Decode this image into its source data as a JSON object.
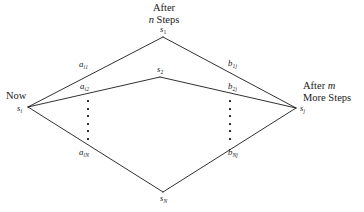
{
  "figure": {
    "type": "state-transition-diagram",
    "headings": {
      "top_line1": "After",
      "top_line2_italic": "n",
      "top_line2_rest": " Steps",
      "left": "Now",
      "right_line1_rest": "After ",
      "right_line1_italic": "m",
      "right_line2": "More Steps"
    },
    "nodes": [
      {
        "id": "now",
        "symbol": "s",
        "sub": "i",
        "sub_italic": true,
        "x": 28,
        "y": 107,
        "label_dx": -11,
        "label_dy": -3
      },
      {
        "id": "mid1",
        "symbol": "s",
        "sub": "1",
        "sub_italic": false,
        "x": 163,
        "y": 37,
        "label_dx": -3,
        "label_dy": -12
      },
      {
        "id": "mid2",
        "symbol": "s",
        "sub": "2",
        "sub_italic": false,
        "x": 160,
        "y": 77,
        "label_dx": -3,
        "label_dy": -12
      },
      {
        "id": "midN",
        "symbol": "s",
        "sub": "N",
        "sub_italic": true,
        "x": 163,
        "y": 192,
        "label_dx": -3,
        "label_dy": 2
      },
      {
        "id": "end",
        "symbol": "s",
        "sub": "j",
        "sub_italic": true,
        "x": 296,
        "y": 108,
        "label_dx": 4,
        "label_dy": -4
      }
    ],
    "edges": [
      {
        "id": "a-i1",
        "from": "now",
        "to": "mid1",
        "symbol": "a",
        "sub": "i1",
        "label_x": 79,
        "label_y": 60
      },
      {
        "id": "a-i2",
        "from": "now",
        "to": "mid2",
        "symbol": "a",
        "sub": "i2",
        "label_x": 80,
        "label_y": 82
      },
      {
        "id": "a-iN",
        "from": "now",
        "to": "midN",
        "symbol": "a",
        "sub": "iN",
        "label_x": 79,
        "label_y": 148
      },
      {
        "id": "b-1j",
        "from": "mid1",
        "to": "end",
        "symbol": "b",
        "sub": "1j",
        "label_x": 228,
        "label_y": 59
      },
      {
        "id": "b-2j",
        "from": "mid2",
        "to": "end",
        "symbol": "b",
        "sub": "2j",
        "label_x": 228,
        "label_y": 82
      },
      {
        "id": "b-Nj",
        "from": "midN",
        "to": "end",
        "symbol": "b",
        "sub": "Nj",
        "label_x": 228,
        "label_y": 148
      }
    ],
    "ellipsis_columns": [
      {
        "id": "left-ellipsis",
        "x": 88,
        "y_top": 100,
        "y_bottom": 140,
        "count": 6
      },
      {
        "id": "right-ellipsis",
        "x": 230,
        "y_top": 100,
        "y_bottom": 140,
        "count": 6
      }
    ],
    "style": {
      "line_color": "#1a1a1a",
      "line_width": 0.9,
      "dot_color": "#111111",
      "background": "#ffffff"
    }
  }
}
